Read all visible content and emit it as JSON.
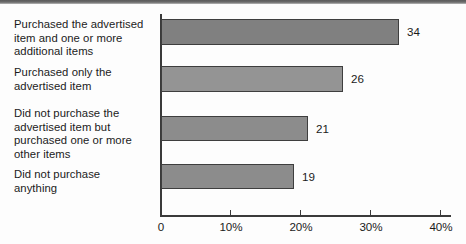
{
  "chart_data": {
    "type": "bar",
    "orientation": "horizontal",
    "title": "",
    "xlabel": "",
    "ylabel": "",
    "categories": [
      "Purchased the advertised\nitem and one or more\nadditional items",
      "Purchased only the\nadvertised item",
      "Did not purchase the\nadvertised item but\npurchased one or more\nother items",
      "Did not purchase\nanything"
    ],
    "values": [
      34,
      26,
      21,
      19
    ],
    "value_labels": [
      "34",
      "26",
      "21",
      "19"
    ],
    "xlim": [
      0,
      40
    ],
    "xticks": [
      0,
      10,
      20,
      30,
      40
    ],
    "xtick_labels": [
      "0",
      "10%",
      "20%",
      "30%",
      "40%"
    ],
    "grid": false,
    "legend": null,
    "bar_fill_color": "#8d8d8d",
    "bar_border_color": "#3e3e3e",
    "axis_color": "#3a3a3a",
    "text_color": "#1b1b1b",
    "background_color": "#fdfdfd"
  }
}
